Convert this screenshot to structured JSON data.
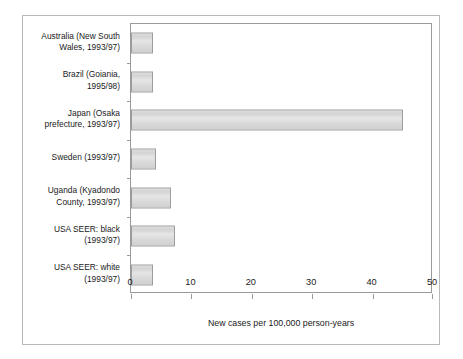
{
  "chart_data": {
    "type": "bar",
    "orientation": "horizontal",
    "title": "",
    "xlabel": "New cases per 100,000 person-years",
    "ylabel": "",
    "xlim": [
      0,
      50
    ],
    "xticks": [
      0,
      10,
      20,
      30,
      40,
      50
    ],
    "xtick_labels": [
      "0",
      "10",
      "20",
      "30",
      "40",
      "50"
    ],
    "grid": false,
    "legend": false,
    "categories": [
      "Australia (New South\nWales, 1993/97)",
      "Brazil (Goiania,\n1995/98)",
      "Japan (Osaka\nprefecture, 1993/97)",
      "Sweden (1993/97)",
      "Uganda (Kyadondo\nCounty, 1993/97)",
      "USA SEER: black\n(1993/97)",
      "USA SEER: white\n(1993/97)"
    ],
    "values": [
      3.7,
      3.7,
      45.0,
      4.2,
      6.6,
      7.3,
      3.7
    ],
    "bar_color": "#d9d9d9",
    "bar_edge_color": "#9d9d9d",
    "axis_color": "#9a9a9a",
    "frame_color": "#b9b9b9",
    "text_color": "#1a1a1a"
  }
}
